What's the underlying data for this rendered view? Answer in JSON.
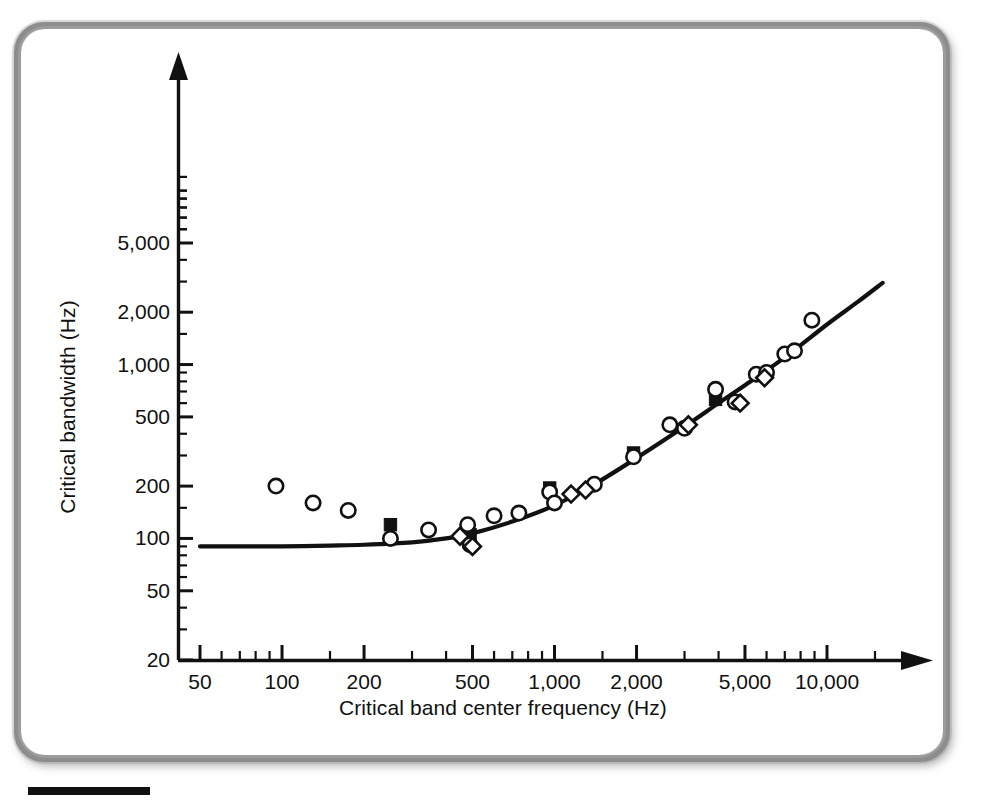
{
  "figure": {
    "kind": "scientific-figure",
    "has_rounded_border": true,
    "border_color": "#8d8d8d",
    "background_color": "#ffffff",
    "credit_bar_color": "#111111"
  },
  "chart_data": {
    "type": "scatter",
    "title": "",
    "subtitle": "",
    "xlabel": "Critical band center frequency (Hz)",
    "ylabel": "Critical bandwidth (Hz)",
    "xscale": "log",
    "yscale": "log",
    "xlim": [
      50,
      16000
    ],
    "ylim": [
      20,
      12000
    ],
    "grid": false,
    "legend": "none",
    "line_color": "#111111",
    "marker_color": "#111111",
    "xticks": [
      50,
      100,
      200,
      500,
      1000,
      2000,
      5000,
      10000
    ],
    "xtick_labels": [
      "50",
      "100",
      "200",
      "500",
      "1,000",
      "2,000",
      "5,000",
      "10,000"
    ],
    "yticks": [
      20,
      50,
      100,
      200,
      500,
      1000,
      2000,
      5000
    ],
    "ytick_labels": [
      "20",
      "50",
      "100",
      "200",
      "500",
      "1,000",
      "2,000",
      "5,000"
    ],
    "x_minor_ticks": [
      60,
      70,
      80,
      90,
      150,
      300,
      400,
      600,
      700,
      800,
      900,
      1500,
      3000,
      4000,
      6000,
      7000,
      8000,
      9000,
      15000
    ],
    "y_minor_ticks": [
      30,
      40,
      60,
      70,
      80,
      90,
      150,
      300,
      400,
      600,
      700,
      800,
      900,
      1500,
      3000,
      4000,
      6000,
      7000,
      8000,
      9000,
      10000
    ],
    "series": [
      {
        "name": "open-circle-measurements",
        "marker": "circle-open",
        "points": [
          [
            95,
            200
          ],
          [
            130,
            160
          ],
          [
            175,
            145
          ],
          [
            250,
            100
          ],
          [
            345,
            112
          ],
          [
            480,
            120
          ],
          [
            490,
            92
          ],
          [
            600,
            135
          ],
          [
            740,
            140
          ],
          [
            960,
            185
          ],
          [
            1000,
            160
          ],
          [
            1400,
            205
          ],
          [
            1950,
            295
          ],
          [
            2650,
            450
          ],
          [
            3000,
            430
          ],
          [
            3900,
            720
          ],
          [
            4600,
            610
          ],
          [
            5500,
            880
          ],
          [
            6000,
            900
          ],
          [
            7000,
            1150
          ],
          [
            7600,
            1200
          ],
          [
            8800,
            1800
          ]
        ]
      },
      {
        "name": "filled-square-measurements",
        "marker": "square-filled",
        "points": [
          [
            250,
            120
          ],
          [
            490,
            105
          ],
          [
            960,
            195
          ],
          [
            1950,
            310
          ],
          [
            3900,
            630
          ]
        ]
      },
      {
        "name": "open-diamond-measurements",
        "marker": "diamond-open",
        "points": [
          [
            450,
            103
          ],
          [
            500,
            90
          ],
          [
            1150,
            180
          ],
          [
            1300,
            190
          ],
          [
            3100,
            450
          ],
          [
            4800,
            600
          ],
          [
            5900,
            840
          ]
        ]
      }
    ],
    "fitted_curve": {
      "name": "critical-bandwidth-fit",
      "description": "Smooth fitted curve: flat near 90 Hz below ~500 Hz, rising toward 3,000 Hz at 16 kHz",
      "points": [
        [
          50,
          90
        ],
        [
          70,
          90
        ],
        [
          100,
          90
        ],
        [
          150,
          91
        ],
        [
          200,
          92
        ],
        [
          300,
          95
        ],
        [
          400,
          100
        ],
        [
          500,
          107
        ],
        [
          700,
          125
        ],
        [
          1000,
          155
        ],
        [
          1400,
          205
        ],
        [
          2000,
          290
        ],
        [
          3000,
          440
        ],
        [
          4000,
          600
        ],
        [
          5000,
          760
        ],
        [
          7000,
          1100
        ],
        [
          10000,
          1700
        ],
        [
          13000,
          2300
        ],
        [
          16000,
          2950
        ]
      ]
    }
  },
  "axes": {
    "x_title": "Critical band center frequency (Hz)",
    "y_title": "Critical bandwidth (Hz)",
    "x_arrow": true,
    "y_arrow": true
  }
}
